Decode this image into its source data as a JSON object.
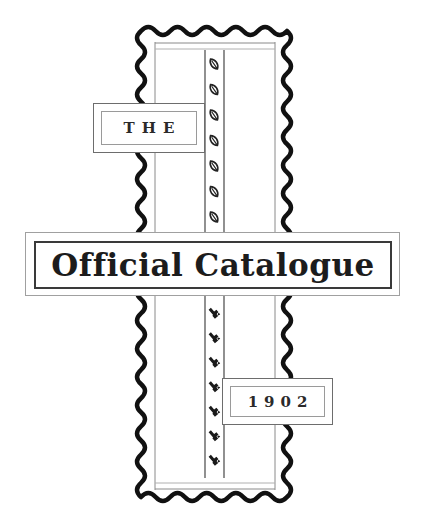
{
  "cover": {
    "top_label": "THE",
    "title": "Official Catalogue",
    "year": "1902"
  },
  "ornaments": {
    "upper_strip_icon": "leaf-icon",
    "upper_strip_count": 7,
    "lower_strip_icon": "hand-pointer-icon",
    "lower_strip_count": 7
  },
  "colors": {
    "ink": "#1c1c1c",
    "rule": "#8a8a8a",
    "paper": "#ffffff"
  }
}
